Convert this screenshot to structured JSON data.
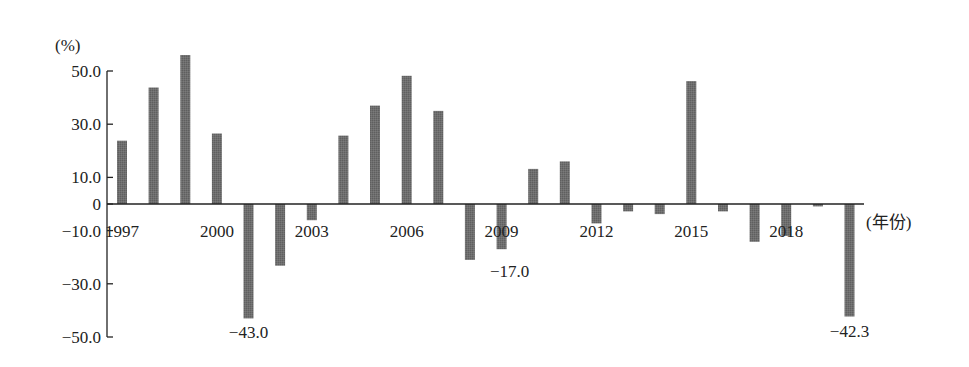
{
  "chart_data": {
    "type": "bar",
    "title": "",
    "xlabel": "(年份)",
    "ylabel": "(%)",
    "ylim": [
      -50,
      50
    ],
    "yticks": [
      50.0,
      30.0,
      10.0,
      0,
      -10.0,
      -30.0,
      -50.0
    ],
    "ytick_labels": [
      "50.0",
      "30.0",
      "10.0",
      "0",
      "-10.0",
      "-30.0",
      "-50.0"
    ],
    "xtick_labels": [
      "1997",
      "2000",
      "2003",
      "2006",
      "2009",
      "2012",
      "2015",
      "2018"
    ],
    "grid": false,
    "legend": null,
    "categories": [
      "1997",
      "1998",
      "1999",
      "2000",
      "2001",
      "2002",
      "2003",
      "2004",
      "2005",
      "2006",
      "2007",
      "2008",
      "2009",
      "2010",
      "2011",
      "2012",
      "2013",
      "2014",
      "2015",
      "2016",
      "2017",
      "2018",
      "2019",
      "2020"
    ],
    "values": [
      23.8,
      43.8,
      56.0,
      26.5,
      -43.0,
      -23.2,
      -6.1,
      25.7,
      37.0,
      48.2,
      35.0,
      -21.0,
      -17.0,
      13.2,
      16.0,
      -7.3,
      -2.8,
      -3.8,
      46.2,
      -2.8,
      -14.2,
      -12.0,
      -0.9,
      -42.3
    ],
    "annotations": [
      {
        "category": "2001",
        "text": "-43.0"
      },
      {
        "category": "2009",
        "text": "-17.0"
      },
      {
        "category": "2020",
        "text": "-42.3"
      }
    ],
    "bar_color": "#6e6e6e",
    "axis_color": "#222222"
  },
  "labels": {
    "y_unit": "(%)",
    "x_unit": "(年份)"
  }
}
